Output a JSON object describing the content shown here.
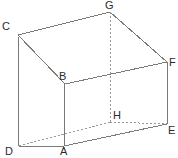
{
  "figure": {
    "name": "labelled-3d-solid",
    "canvas": {
      "width": 178,
      "height": 158
    },
    "style": {
      "background_color": "#ffffff",
      "solid_edge_color": "#7a7a7a",
      "hidden_edge_color": "#9a9a9a",
      "label_color": "#2b2b2b",
      "solid_edge_width": 1,
      "hidden_edge_width": 1,
      "hidden_edge_dash": "2,2"
    },
    "vertices": [
      {
        "id": "A",
        "label": "A",
        "x": 64,
        "y": 146,
        "label_x": 60,
        "label_y": 146,
        "hidden": false
      },
      {
        "id": "B",
        "label": "B",
        "x": 65,
        "y": 84,
        "label_x": 59,
        "label_y": 71,
        "hidden": false
      },
      {
        "id": "C",
        "label": "C",
        "x": 18,
        "y": 35,
        "label_x": 2,
        "label_y": 21,
        "hidden": false
      },
      {
        "id": "D",
        "label": "D",
        "x": 19,
        "y": 146,
        "label_x": 5,
        "label_y": 146,
        "hidden": false
      },
      {
        "id": "E",
        "label": "E",
        "x": 167,
        "y": 124,
        "label_x": 168,
        "label_y": 125,
        "hidden": false
      },
      {
        "id": "F",
        "label": "F",
        "x": 167,
        "y": 62,
        "label_x": 169,
        "label_y": 57,
        "hidden": false
      },
      {
        "id": "G",
        "label": "G",
        "x": 110,
        "y": 12,
        "label_x": 105,
        "label_y": 0,
        "hidden": false
      },
      {
        "id": "H",
        "label": "H",
        "x": 110,
        "y": 122,
        "label_x": 113,
        "label_y": 110,
        "hidden": true
      }
    ],
    "edges": [
      {
        "from": "C",
        "to": "G",
        "hidden": false,
        "name": "edge-c-g"
      },
      {
        "from": "G",
        "to": "F",
        "hidden": false,
        "name": "edge-g-f"
      },
      {
        "from": "F",
        "to": "B",
        "hidden": false,
        "name": "edge-f-b"
      },
      {
        "from": "B",
        "to": "C",
        "hidden": false,
        "name": "edge-b-c"
      },
      {
        "from": "C",
        "to": "D",
        "hidden": false,
        "name": "edge-c-d"
      },
      {
        "from": "B",
        "to": "A",
        "hidden": false,
        "name": "edge-b-a"
      },
      {
        "from": "F",
        "to": "E",
        "hidden": false,
        "name": "edge-f-e"
      },
      {
        "from": "G",
        "to": "H",
        "hidden": true,
        "name": "edge-g-h"
      },
      {
        "from": "D",
        "to": "A",
        "hidden": false,
        "name": "edge-d-a"
      },
      {
        "from": "A",
        "to": "E",
        "hidden": false,
        "name": "edge-a-e"
      },
      {
        "from": "D",
        "to": "H",
        "hidden": true,
        "name": "edge-d-h"
      },
      {
        "from": "H",
        "to": "E",
        "hidden": true,
        "name": "edge-h-e"
      }
    ]
  }
}
